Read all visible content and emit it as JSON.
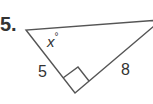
{
  "problem": {
    "number_label": "5.",
    "angle_label": "x",
    "angle_unit": "°",
    "side_labels": [
      "5",
      "8"
    ]
  },
  "figure": {
    "type": "right-triangle",
    "stroke_color": "#555555",
    "vertices": {
      "top_left": [
        26,
        30
      ],
      "top_right_offscreen": [
        160,
        20
      ],
      "bottom_right_angle": [
        75,
        93
      ]
    },
    "right_angle_marker": true
  }
}
